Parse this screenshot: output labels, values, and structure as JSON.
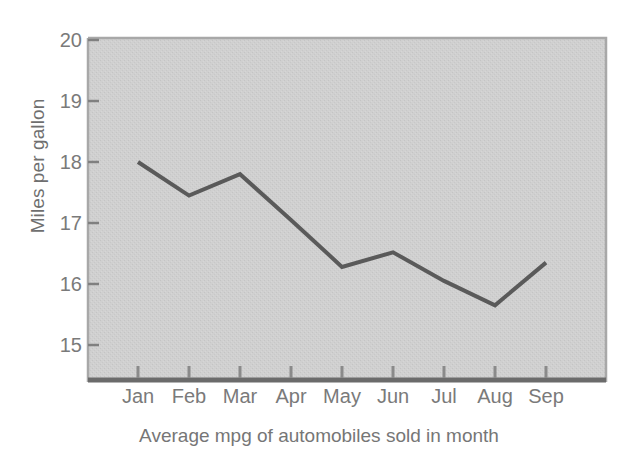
{
  "chart_data": {
    "type": "line",
    "title": "",
    "subtitle": "",
    "xlabel": "Average mpg of automobiles sold in month",
    "ylabel": "Miles per gallon",
    "categories": [
      "Jan",
      "Feb",
      "Mar",
      "Apr",
      "May",
      "Jun",
      "Jul",
      "Aug",
      "Sep"
    ],
    "values": [
      18.0,
      17.45,
      17.8,
      17.05,
      16.28,
      16.52,
      16.05,
      15.65,
      16.35
    ],
    "series": [
      {
        "name": "Average mpg",
        "values": [
          18.0,
          17.45,
          17.8,
          17.05,
          16.28,
          16.52,
          16.05,
          15.65,
          16.35
        ]
      }
    ],
    "ylim": [
      14.5,
      20
    ],
    "ytick_values": [
      15,
      16,
      17,
      18,
      19,
      20
    ],
    "ytick_labels": [
      "15",
      "16",
      "17",
      "18",
      "19",
      "20"
    ],
    "xtick_labels": [
      "Jan",
      "Feb",
      "Mar",
      "Apr",
      "May",
      "Jun",
      "Jul",
      "Aug",
      "Sep"
    ],
    "grid": false,
    "legend": false,
    "legend_position": "none",
    "colors": {
      "line": "#5a5a5a",
      "plot_background": "#cfcfcf",
      "frame": "#a3a3a3",
      "axis_bottom": "#6b6b6b",
      "tick": "#7d7d7d",
      "text": "#767676",
      "page_background": "#ffffff"
    },
    "line_width": 4,
    "markers": "none"
  }
}
